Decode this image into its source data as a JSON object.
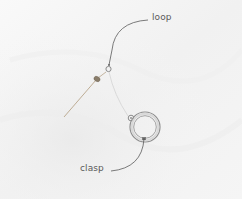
{
  "image": {
    "description": "Photograph of a spring ring jewelry clasp attached to a headpin loop, with annotated labels",
    "background_color": "#f6f6f6",
    "annotation_color": "#5a5a5a"
  },
  "labels": {
    "loop": "loop",
    "clasp": "clasp"
  }
}
